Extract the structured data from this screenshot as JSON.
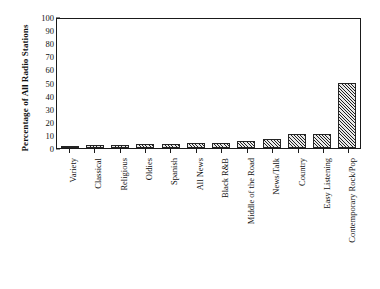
{
  "chart_data": {
    "type": "bar",
    "title": "",
    "xlabel": "",
    "ylabel": "Percentage of All Radio Stations",
    "ylim": [
      0,
      100
    ],
    "yticks": [
      0,
      10,
      20,
      30,
      40,
      50,
      60,
      70,
      80,
      90,
      100
    ],
    "grid": false,
    "legend": "none",
    "bar_fill": "diagonal-hatch",
    "bar_edge_color": "#242424",
    "categories": [
      "Variety",
      "Classical",
      "Religious",
      "Oldies",
      "Spanish",
      "All News",
      "Black R&B",
      "Middle of the Road",
      "News/Talk",
      "Country",
      "Easy Listening",
      "Contemporary Rock/Pop"
    ],
    "values": [
      1,
      2,
      2,
      3,
      3,
      4,
      4,
      5,
      7,
      11,
      11,
      50
    ]
  }
}
